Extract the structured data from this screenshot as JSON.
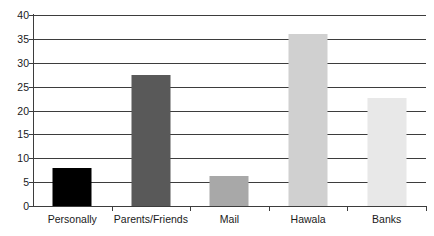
{
  "chart_data": {
    "type": "bar",
    "title": "",
    "title_note": "cut off at top edge of screenshot",
    "xlabel": "",
    "ylabel": "",
    "categories": [
      "Personally",
      "Parents/Friends",
      "Mail",
      "Hawala",
      "Banks"
    ],
    "values": [
      8,
      27.5,
      6.3,
      36,
      22.6
    ],
    "series": [
      {
        "name": "",
        "values": [
          8,
          27.5,
          6.3,
          36,
          22.6
        ]
      }
    ],
    "bar_colors": [
      "#000000",
      "#595959",
      "#a8a8a8",
      "#d0d0d0",
      "#e8e8e8"
    ],
    "ylim": [
      0,
      40
    ],
    "ytick_values": [
      0,
      5,
      10,
      15,
      20,
      25,
      30,
      35,
      40
    ],
    "ytick_labels": [
      "0",
      "5",
      "10",
      "15",
      "20",
      "25",
      "30",
      "35",
      "40"
    ],
    "grid": true,
    "grid_axis": "y",
    "legend": false,
    "legend_position": "none",
    "axis_color": "#3d3d3d",
    "background_color": "#ffffff",
    "text_color": "#1a1a1a"
  }
}
